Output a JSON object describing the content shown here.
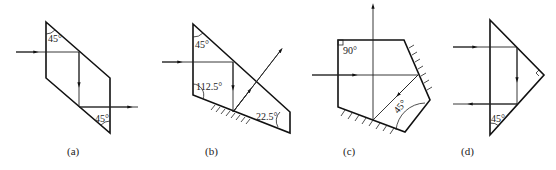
{
  "figure": {
    "panels": [
      {
        "id": "a",
        "caption": "(a)",
        "angles": [
          "45°",
          "45°"
        ]
      },
      {
        "id": "b",
        "caption": "(b)",
        "angles": [
          "45°",
          "112.5°",
          "22.5°"
        ]
      },
      {
        "id": "c",
        "caption": "(c)",
        "angles": [
          "90°",
          "45°"
        ]
      },
      {
        "id": "d",
        "caption": "(d)",
        "angles": [
          "45°"
        ]
      }
    ]
  },
  "colors": {
    "stroke": "#111111",
    "background": "#ffffff"
  }
}
